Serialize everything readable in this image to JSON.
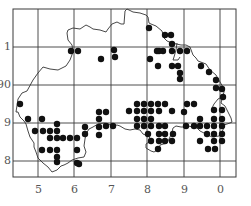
{
  "map": {
    "frame": {
      "x1": 13,
      "y1": 9,
      "x2": 236,
      "y2": 177
    },
    "grid_x": [
      38,
      74,
      111,
      147,
      184,
      220
    ],
    "grid_y": [
      47,
      85,
      123,
      161
    ],
    "x_labels": [
      {
        "text": "5",
        "x": 38
      },
      {
        "text": "6",
        "x": 74
      },
      {
        "text": "7",
        "x": 111
      },
      {
        "text": "8",
        "x": 147
      },
      {
        "text": "9",
        "x": 184
      },
      {
        "text": "0",
        "x": 220
      }
    ],
    "y_labels": [
      {
        "text": "1",
        "y": 47
      },
      {
        "text": "90",
        "y": 85
      },
      {
        "text": "9",
        "y": 123
      },
      {
        "text": "8",
        "y": 161
      }
    ],
    "outline": "M16,112 L18,99 L22,93 L27,91 L33,80 L38,73 L43,67 L50,69 L58,70 L62,68 L66,66 L70,60 L73,52 L72,45 L68,40 L67,33 L68,30 L73,28 L80,29 L86,25 L90,27 L93,29 L100,30 L106,32 L108,29 L112,24 L117,22 L121,24 L124,24 L125,11 L127,9 L133,12 L140,13 L146,15 L148,17 L149,23 L151,24 L156,26 L162,31 L164,38 L167,41 L172,43 L181,45 L186,45 L190,47 L193,55 L196,58 L198,61 L206,64 L210,70 L216,75 L220,82 L223,87 L224,92 L222,99 L221,103 L225,106 L228,112 L231,118 L232,122 L230,123 L224,125 L223,130 L219,136 L212,137 L206,134 L200,131 L197,128 L193,127 L188,126 L185,127 L181,127 L176,126 L173,128 L172,132 L170,137 L167,143 L160,145 L159,149 L154,152 L151,151 L146,148 L146,144 L152,140 L148,136 L143,134 L140,130 L135,129 L130,130 L125,129 L120,126 L117,125 L113,126 L108,124 L104,123 L98,124 L93,127 L89,129 L86,134 L85,139 L84,146 L86,152 L84,157 L78,158 L72,160 L68,163 L64,165 L61,166 L57,170 L52,172 L48,167 L43,163 L38,158 L36,152 L34,147 L34,143 L30,137 L28,131 L26,124 L24,121 L20,117 L18,112 Z",
    "inlet": "M177,43 L176,50 L174,57 L173,60 L178,60 L180,57 M212,108 L214,104 L218,99 L220,98",
    "dots": [
      [
        71,
        51
      ],
      [
        78,
        51
      ],
      [
        114,
        50
      ],
      [
        101,
        59
      ],
      [
        115,
        57
      ],
      [
        149,
        28
      ],
      [
        165,
        35
      ],
      [
        171,
        35
      ],
      [
        172,
        44
      ],
      [
        172,
        51
      ],
      [
        163,
        51
      ],
      [
        159,
        51
      ],
      [
        157,
        51
      ],
      [
        180,
        51
      ],
      [
        187,
        51
      ],
      [
        150,
        59
      ],
      [
        158,
        66
      ],
      [
        172,
        66
      ],
      [
        178,
        66
      ],
      [
        180,
        73
      ],
      [
        180,
        79
      ],
      [
        201,
        66
      ],
      [
        209,
        72
      ],
      [
        216,
        80
      ],
      [
        216,
        88
      ],
      [
        222,
        89
      ],
      [
        223,
        97
      ],
      [
        20,
        104
      ],
      [
        28,
        119
      ],
      [
        42,
        119
      ],
      [
        35,
        131
      ],
      [
        43,
        131
      ],
      [
        50,
        131
      ],
      [
        57,
        131
      ],
      [
        57,
        124
      ],
      [
        57,
        138
      ],
      [
        50,
        138
      ],
      [
        63,
        138
      ],
      [
        70,
        138
      ],
      [
        77,
        138
      ],
      [
        77,
        150
      ],
      [
        42,
        150
      ],
      [
        50,
        150
      ],
      [
        57,
        150
      ],
      [
        57,
        157
      ],
      [
        57,
        162
      ],
      [
        77,
        163
      ],
      [
        79,
        164
      ],
      [
        99,
        112
      ],
      [
        106,
        112
      ],
      [
        99,
        119
      ],
      [
        99,
        127
      ],
      [
        106,
        126
      ],
      [
        113,
        126
      ],
      [
        99,
        135
      ],
      [
        85,
        127
      ],
      [
        85,
        134
      ],
      [
        137,
        104
      ],
      [
        144,
        104
      ],
      [
        151,
        104
      ],
      [
        158,
        104
      ],
      [
        165,
        104
      ],
      [
        129,
        111
      ],
      [
        137,
        111
      ],
      [
        144,
        111
      ],
      [
        151,
        111
      ],
      [
        159,
        111
      ],
      [
        172,
        111
      ],
      [
        137,
        119
      ],
      [
        144,
        119
      ],
      [
        151,
        119
      ],
      [
        137,
        126
      ],
      [
        144,
        126
      ],
      [
        151,
        126
      ],
      [
        159,
        126
      ],
      [
        165,
        126
      ],
      [
        187,
        104
      ],
      [
        194,
        104
      ],
      [
        214,
        110
      ],
      [
        222,
        110
      ],
      [
        184,
        112
      ],
      [
        200,
        119
      ],
      [
        214,
        119
      ],
      [
        222,
        119
      ],
      [
        186,
        126
      ],
      [
        194,
        126
      ],
      [
        200,
        126
      ],
      [
        207,
        126
      ],
      [
        214,
        126
      ],
      [
        222,
        126
      ],
      [
        148,
        134
      ],
      [
        159,
        134
      ],
      [
        165,
        134
      ],
      [
        173,
        134
      ],
      [
        207,
        134
      ],
      [
        214,
        134
      ],
      [
        222,
        134
      ],
      [
        151,
        141
      ],
      [
        159,
        141
      ],
      [
        165,
        141
      ],
      [
        172,
        141
      ],
      [
        158,
        149
      ],
      [
        200,
        141
      ],
      [
        214,
        141
      ],
      [
        222,
        141
      ],
      [
        208,
        149
      ],
      [
        215,
        149
      ]
    ],
    "dot_radius": 3.2,
    "colors": {
      "grid": "#3a3a3a",
      "outline": "#333333",
      "dot": "#111111",
      "label": "#555555"
    }
  }
}
